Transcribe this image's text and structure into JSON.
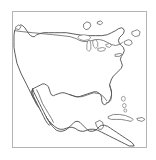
{
  "document": {
    "type": "map-thumbnail",
    "title": "North America Outline Map",
    "caption_text": "",
    "caption_legible": false
  },
  "frame": {
    "border_color": "#b4b4b4",
    "background_color": "#ffffff",
    "x": 12,
    "y": 11,
    "width": 135,
    "height": 137
  },
  "map": {
    "region": "North America",
    "projection_hint": "equirectangular-crop",
    "style": "line-outline",
    "fill_color": "#ffffff",
    "coastline_color": "#4a4a4a",
    "border_color": "#555555",
    "island_color": "#6b6b6b",
    "features": [
      {
        "name": "contiguous-united-states",
        "kind": "landmass"
      },
      {
        "name": "mexico",
        "kind": "landmass"
      },
      {
        "name": "baja-california-peninsula",
        "kind": "peninsula"
      },
      {
        "name": "florida-peninsula",
        "kind": "peninsula"
      },
      {
        "name": "yucatan-peninsula",
        "kind": "peninsula"
      },
      {
        "name": "central-america",
        "kind": "landmass"
      },
      {
        "name": "great-lakes",
        "kind": "lakes"
      },
      {
        "name": "usa-canada-border",
        "kind": "political-border"
      },
      {
        "name": "cuba",
        "kind": "island"
      },
      {
        "name": "bahamas",
        "kind": "island-group"
      },
      {
        "name": "long-island",
        "kind": "island"
      },
      {
        "name": "nova-scotia",
        "kind": "island"
      }
    ],
    "labels": []
  }
}
